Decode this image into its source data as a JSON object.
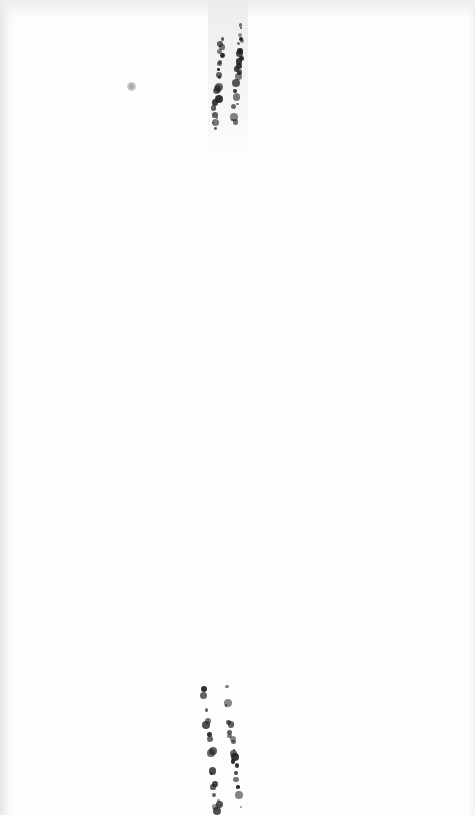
{
  "image": {
    "description": "Scanned mostly blank white surface with two pairs of speckled dark vertical streaks (top center and bottom center) and a small grey spot at upper left",
    "background_color": "#fdfdfd",
    "speck_color": "#222222",
    "spot_color": "#9a9a9a",
    "streaks": [
      {
        "name": "top-left-streak",
        "x_start": 222,
        "y_start": 40,
        "x_end": 214,
        "y_end": 130
      },
      {
        "name": "top-right-streak",
        "x_start": 243,
        "y_start": 22,
        "x_end": 233,
        "y_end": 130
      },
      {
        "name": "bottom-left-streak",
        "x_start": 204,
        "y_start": 690,
        "x_end": 218,
        "y_end": 815
      },
      {
        "name": "bottom-right-streak",
        "x_start": 226,
        "y_start": 688,
        "x_end": 240,
        "y_end": 810
      }
    ]
  }
}
